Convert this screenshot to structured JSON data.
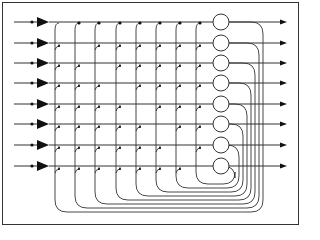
{
  "diagram": {
    "type": "crossbar-recurrent-network",
    "rows": 8,
    "row_y": [
      22,
      43,
      63,
      83,
      104,
      124,
      145,
      166
    ],
    "col_x": [
      55,
      75,
      95,
      116,
      136,
      156,
      176,
      196
    ],
    "neuron_x": 221,
    "neuron_r": 8,
    "input_start_x": 14,
    "input_dot_x": 32,
    "amp_x": 37,
    "amp_w": 12,
    "output_end_x": 287,
    "loop_base_y": 178,
    "loop_step": 4,
    "colors": {
      "line": "#333333",
      "fill": "#111111"
    }
  }
}
